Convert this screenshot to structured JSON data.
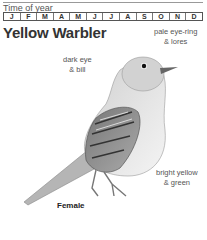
{
  "header": {
    "time_of_year_label": "Time of year",
    "months": [
      "J",
      "F",
      "M",
      "A",
      "M",
      "J",
      "J",
      "A",
      "S",
      "O",
      "N",
      "D"
    ]
  },
  "species": {
    "name": "Yellow Warbler",
    "sex_label": "Female"
  },
  "annotations": {
    "eye_ring": [
      "pale eye-ring",
      "& lores"
    ],
    "eye_bill": [
      "dark eye",
      "& bill"
    ],
    "color": [
      "bright yellow",
      "& green"
    ]
  },
  "colors": {
    "text": "#333333",
    "rule": "#999999"
  }
}
